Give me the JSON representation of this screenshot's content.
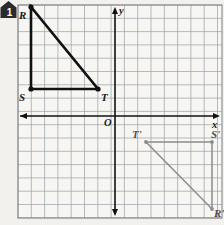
{
  "badge": {
    "number": "1",
    "icon": "home-icon"
  },
  "axes": {
    "x_label": "x",
    "y_label": "y",
    "origin_label": "O"
  },
  "grid": {
    "cell_px": 13.3,
    "left": 18,
    "top": 5,
    "right": 222,
    "bottom": 218,
    "line_color": "#9aa0a6",
    "background": "#f7f6f3"
  },
  "figures": {
    "preimage": {
      "name": "triangle-RST",
      "color": "#111111",
      "points": [
        {
          "label": "R",
          "x": 31,
          "y": 7,
          "label_dx": -12,
          "label_dy": 3
        },
        {
          "label": "S",
          "x": 31,
          "y": 89,
          "label_dx": -12,
          "label_dy": 3
        },
        {
          "label": "T",
          "x": 98,
          "y": 89,
          "label_dx": 3,
          "label_dy": 3
        }
      ]
    },
    "image": {
      "name": "triangle-R-prime-S-prime-T-prime",
      "color": "#8c8c8c",
      "points": [
        {
          "label": "T'",
          "x": 146,
          "y": 142,
          "label_dx": -14,
          "label_dy": -13
        },
        {
          "label": "S'",
          "x": 212,
          "y": 142,
          "label_dx": -1,
          "label_dy": -13
        },
        {
          "label": "R'",
          "x": 212,
          "y": 209,
          "label_dx": 2,
          "label_dy": -1
        }
      ]
    }
  }
}
